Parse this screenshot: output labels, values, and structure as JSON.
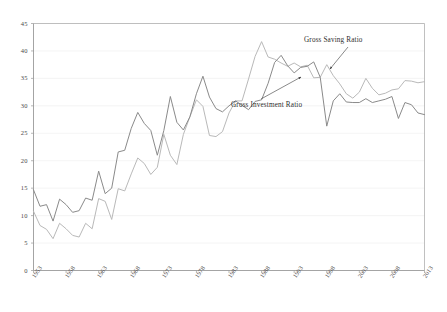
{
  "chart_data": {
    "type": "line",
    "title": "",
    "subtitle": "",
    "xlabel": "",
    "ylabel": "",
    "grid": true,
    "legend_position": "inline-annotations",
    "xlim": [
      1953,
      2013
    ],
    "ylim": [
      0,
      45
    ],
    "y_ticks": [
      0,
      5,
      10,
      15,
      20,
      25,
      30,
      35,
      40,
      45
    ],
    "x_ticks": [
      1953,
      1958,
      1963,
      1968,
      1973,
      1978,
      1983,
      1988,
      1993,
      1998,
      2003,
      2008,
      2013
    ],
    "x": [
      1953,
      1954,
      1955,
      1956,
      1957,
      1958,
      1959,
      1960,
      1961,
      1962,
      1963,
      1964,
      1965,
      1966,
      1967,
      1968,
      1969,
      1970,
      1971,
      1972,
      1973,
      1974,
      1975,
      1976,
      1977,
      1978,
      1979,
      1980,
      1981,
      1982,
      1983,
      1984,
      1985,
      1986,
      1987,
      1988,
      1989,
      1990,
      1991,
      1992,
      1993,
      1994,
      1995,
      1996,
      1997,
      1998,
      1999,
      2000,
      2001,
      2002,
      2003,
      2004,
      2005,
      2006,
      2007,
      2008,
      2009,
      2010,
      2011,
      2012,
      2013
    ],
    "series": [
      {
        "name": "Gross Investment Ratio",
        "color": "#8a8a8a",
        "values": [
          14.7,
          11.7,
          12.0,
          9.0,
          13.0,
          12.0,
          10.6,
          10.9,
          13.2,
          12.8,
          18.1,
          14.0,
          15.0,
          21.6,
          21.9,
          25.9,
          28.8,
          26.8,
          25.5,
          21.0,
          25.5,
          31.7,
          27.0,
          25.6,
          28.0,
          32.2,
          35.4,
          31.6,
          29.5,
          28.9,
          30.0,
          30.9,
          30.1,
          29.3,
          30.8,
          31.1,
          34.1,
          37.9,
          39.2,
          37.3,
          36.0,
          37.0,
          37.2,
          38.0,
          35.2,
          26.3,
          30.9,
          32.2,
          30.7,
          30.6,
          30.6,
          31.3,
          30.6,
          30.9,
          31.2,
          31.7,
          27.7,
          30.6,
          30.2,
          28.7,
          28.4
        ]
      },
      {
        "name": "Gross Saving Ratio",
        "color": "#b9b9b9",
        "values": [
          10.8,
          8.2,
          7.5,
          5.8,
          8.6,
          7.6,
          6.4,
          6.1,
          8.6,
          7.6,
          13.1,
          12.6,
          9.3,
          14.9,
          14.5,
          17.6,
          20.5,
          19.5,
          17.5,
          18.8,
          24.8,
          21.0,
          19.3,
          24.8,
          28.0,
          31.1,
          29.9,
          24.6,
          24.4,
          25.3,
          28.7,
          30.9,
          30.9,
          34.9,
          39.0,
          41.7,
          38.9,
          38.5,
          37.8,
          37.2,
          37.8,
          37.1,
          37.4,
          35.1,
          35.2,
          37.5,
          35.5,
          34.0,
          32.2,
          31.4,
          32.5,
          35.0,
          33.2,
          32.0,
          32.3,
          32.9,
          33.1,
          34.6,
          34.5,
          34.2,
          34.4
        ]
      }
    ],
    "annotations": [
      {
        "text": "Gross Saving Ratio",
        "label_x": 304,
        "label_y": 36,
        "arrow_from_x": 348,
        "arrow_from_y": 47,
        "arrow_to_x": 330,
        "arrow_to_y": 69
      },
      {
        "text": "Gross Investment Ratio",
        "label_x": 231,
        "label_y": 101,
        "arrow_from_x": 261,
        "arrow_from_y": 99,
        "arrow_to_x": 301,
        "arrow_to_y": 77
      }
    ],
    "colors": {
      "investment_line": "#8a8a8a",
      "saving_line": "#b9b9b9",
      "axis": "#b0b0b0",
      "gridline": "#ececec",
      "text": "#3a3a3a"
    }
  }
}
